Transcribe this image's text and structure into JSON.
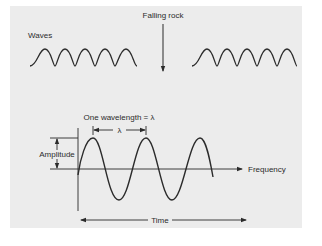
{
  "diagram": {
    "top": {
      "waves_label": "Waves",
      "rock_label": "Falling rock"
    },
    "bottom": {
      "wavelength_label": "One wavelength = λ",
      "lambda_label": "λ",
      "amplitude_label": "Amplitude",
      "frequency_label": "Frequency",
      "time_label": "Time"
    },
    "colors": {
      "panel_background": "#ececec",
      "page_background": "#ffffff",
      "ink": "#2b2b2b"
    }
  }
}
